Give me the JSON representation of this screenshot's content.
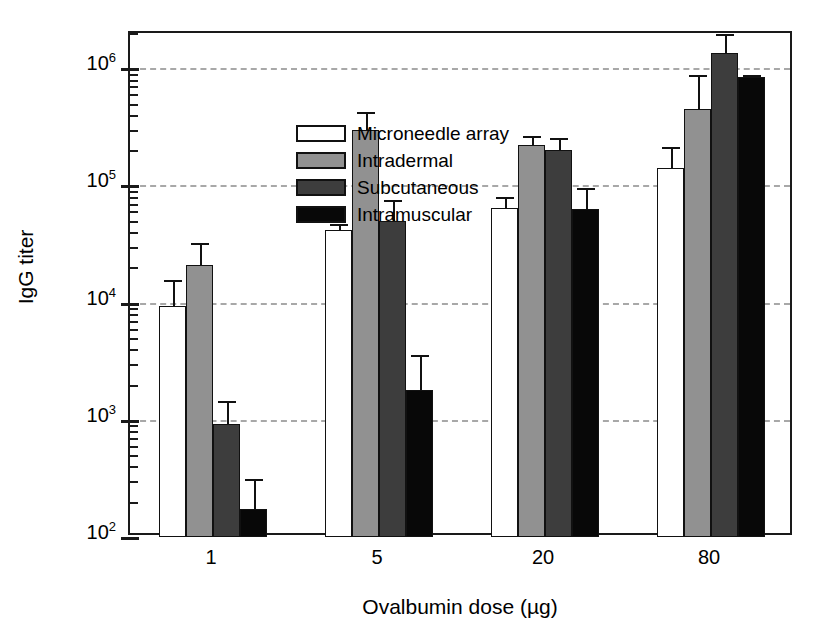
{
  "chart_data": {
    "type": "bar",
    "title": "",
    "xlabel": "Ovalbumin dose (µg)",
    "ylabel": "IgG titer",
    "categories": [
      "1",
      "5",
      "20",
      "80"
    ],
    "yscale": "log",
    "ylim": [
      100,
      2000000
    ],
    "ytick_labels": [
      "10⁶",
      "10⁵",
      "10⁴",
      "10³",
      "10²"
    ],
    "ytick_values": [
      1000000,
      100000,
      10000,
      1000,
      100
    ],
    "grid": "horizontal-dashed",
    "legend_position": "upper-left-inside",
    "series": [
      {
        "name": "Microneedle array",
        "color": "#ffffff",
        "values": [
          9300,
          42000,
          64000,
          140000
        ],
        "err_upper": [
          15500,
          47000,
          80000,
          215000
        ],
        "err_lower": [
          9300,
          42000,
          64000,
          140000
        ]
      },
      {
        "name": "Intradermal",
        "color": "#919191",
        "values": [
          21000,
          300000,
          220000,
          450000
        ],
        "err_upper": [
          32000,
          420000,
          265000,
          880000
        ],
        "err_lower": [
          21000,
          300000,
          220000,
          450000
        ]
      },
      {
        "name": "Subcutaneous",
        "color": "#3d3d3d",
        "values": [
          930,
          50000,
          200000,
          1350000
        ],
        "err_upper": [
          1450,
          75000,
          255000,
          1950000
        ],
        "err_lower": [
          930,
          50000,
          200000,
          1350000
        ]
      },
      {
        "name": "Intramuscular",
        "color": "#080808",
        "values": [
          175,
          1800,
          63000,
          840000
        ],
        "err_upper": [
          310,
          3600,
          95000,
          880000
        ],
        "err_lower": [
          175,
          1800,
          63000,
          840000
        ]
      }
    ]
  },
  "legend": {
    "items": [
      {
        "label": "Microneedle array",
        "swatch": "white"
      },
      {
        "label": "Intradermal",
        "swatch": "gray"
      },
      {
        "label": "Subcutaneous",
        "swatch": "dgray"
      },
      {
        "label": "Intramuscular",
        "swatch": "black"
      }
    ]
  },
  "axes": {
    "y_label": "IgG titer",
    "x_label": "Ovalbumin dose (µg)",
    "y_ticks": [
      {
        "label_base": "10",
        "label_exp": "6"
      },
      {
        "label_base": "10",
        "label_exp": "5"
      },
      {
        "label_base": "10",
        "label_exp": "4"
      },
      {
        "label_base": "10",
        "label_exp": "3"
      },
      {
        "label_base": "10",
        "label_exp": "2"
      }
    ],
    "x_ticks": [
      "1",
      "5",
      "20",
      "80"
    ]
  },
  "colors": {
    "microneedle": "#ffffff",
    "intradermal": "#919191",
    "subcutaneous": "#3d3d3d",
    "intramuscular": "#080808",
    "grid": "#a8a8a8",
    "axis": "#1a1a1a"
  }
}
